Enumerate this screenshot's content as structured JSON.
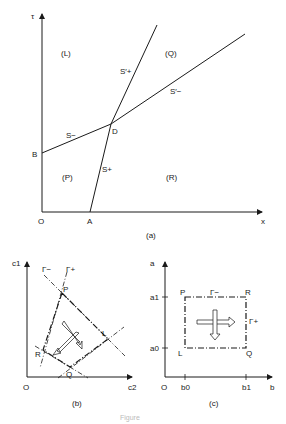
{
  "figure": {
    "caption_faded": "Figure",
    "panel_a": {
      "caption": "(a)",
      "axis_y": "τ",
      "axis_x": "x",
      "origin": "O",
      "point_A": "A",
      "point_B": "B",
      "point_D": "D",
      "region_L": "(L)",
      "region_Q": "(Q)",
      "region_P": "(P)",
      "region_R": "(R)",
      "line_S_minus": "S−",
      "line_S_plus": "S+",
      "line_S_plus_prime": "S′+",
      "line_S_minus_prime": "S′−"
    },
    "panel_b": {
      "caption": "(b)",
      "axis_y": "c1",
      "axis_x": "c2",
      "origin": "O",
      "gamma_minus": "Γ−",
      "gamma_plus": "Γ+",
      "point_P": "P",
      "point_L": "L",
      "point_Q": "Q",
      "point_R": "R"
    },
    "panel_c": {
      "caption": "(c)",
      "axis_y": "a",
      "axis_x": "b",
      "origin": "O",
      "tick_a1": "a1",
      "tick_a0": "a0",
      "tick_b0": "b0",
      "tick_b1": "b1",
      "gamma_minus": "Γ−",
      "gamma_plus": "Γ+",
      "point_P": "P",
      "point_R": "R",
      "point_L": "L",
      "point_Q": "Q"
    }
  }
}
